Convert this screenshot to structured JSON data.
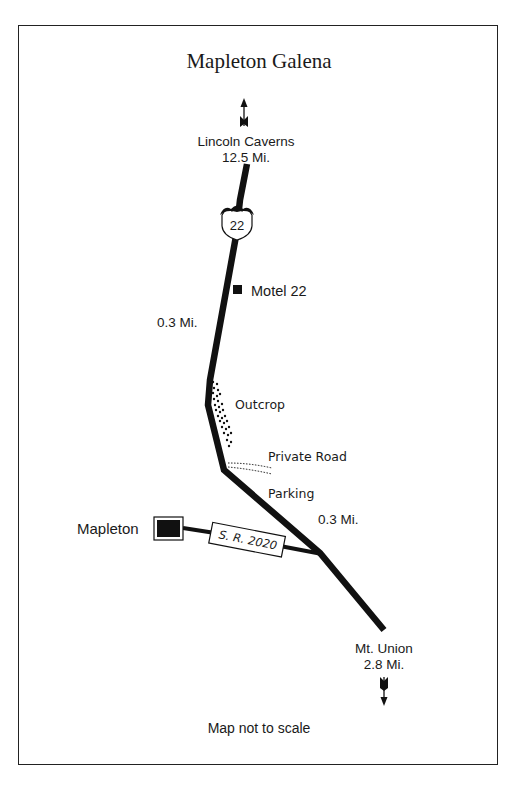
{
  "map": {
    "title": "Mapleton Galena",
    "note": "Map not to scale",
    "colors": {
      "road": "#111111",
      "background": "#ffffff",
      "frame": "#222222",
      "text": "#1a1a1a"
    },
    "north_destination": {
      "name": "Lincoln Caverns",
      "distance": "12.5 Mi."
    },
    "south_destination": {
      "name": "Mt. Union",
      "distance": "2.8 Mi."
    },
    "route_shield": {
      "label": "22",
      "type": "US route shield"
    },
    "side_road": {
      "label": "S. R. 2020"
    },
    "town": {
      "name": "Mapleton"
    },
    "landmarks": [
      {
        "name": "Motel 22",
        "symbol": "filled-square"
      },
      {
        "name": "Outcrop",
        "symbol": "dotted-area"
      },
      {
        "name": "Private Road",
        "symbol": "dotted-lines"
      },
      {
        "name": "Parking",
        "symbol": "text"
      }
    ],
    "distances": [
      {
        "label": "0.3 Mi.",
        "segment": "Motel 22 to Outcrop"
      },
      {
        "label": "0.3 Mi.",
        "segment": "Parking to S. R. 2020 junction"
      }
    ]
  }
}
